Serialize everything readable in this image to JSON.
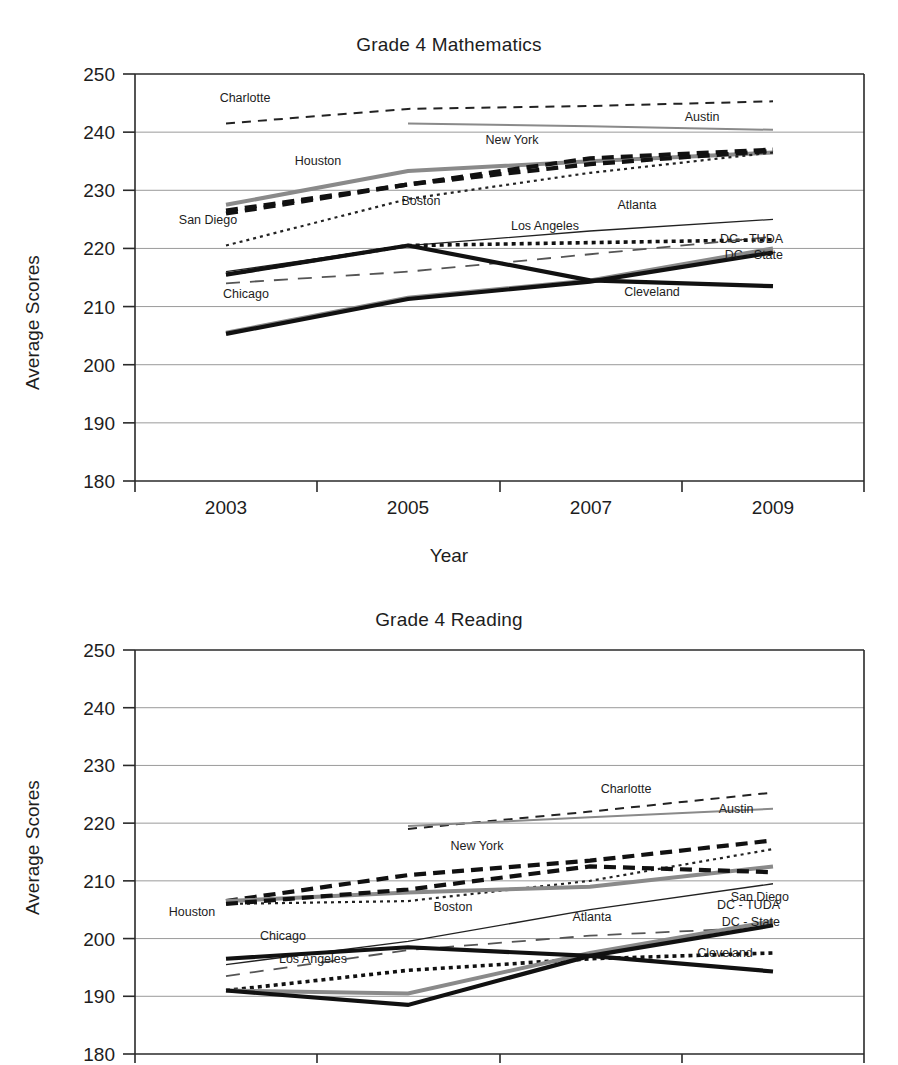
{
  "charts": [
    {
      "id": "math",
      "title": "Grade 4 Mathematics",
      "ylabel": "Average Scores",
      "xlabel": "Year"
    },
    {
      "id": "reading",
      "title": "Grade 4 Reading",
      "ylabel": "Average Scores",
      "xlabel": ""
    }
  ],
  "chart_data": [
    {
      "type": "line",
      "title": "Grade 4 Mathematics",
      "xlabel": "Year",
      "ylabel": "Average Scores",
      "x": [
        2003,
        2005,
        2007,
        2009
      ],
      "xticklabels": [
        "2003",
        "2005",
        "2007",
        "2009"
      ],
      "yticklabels": [
        "180",
        "190",
        "200",
        "210",
        "220",
        "230",
        "240",
        "250"
      ],
      "ylim": [
        180,
        250
      ],
      "grid": true,
      "legend": "inline-annotations",
      "series": [
        {
          "name": "Charlotte",
          "values": [
            241.5,
            244.0,
            244.5,
            245.3
          ],
          "style": "dashed-thin",
          "color": "#222222"
        },
        {
          "name": "Austin",
          "values": [
            null,
            241.5,
            241.0,
            240.4
          ],
          "style": "solid-gray",
          "color": "#8a8a8a"
        },
        {
          "name": "Houston",
          "values": [
            227.5,
            233.3,
            235.0,
            236.5
          ],
          "style": "solid-gray-thick",
          "color": "#8a8a8a"
        },
        {
          "name": "New York",
          "values": [
            226.0,
            231.0,
            235.5,
            237.0
          ],
          "style": "dashed-bold",
          "color": "#111111"
        },
        {
          "name": "Boston",
          "values": [
            220.5,
            228.5,
            233.0,
            236.5
          ],
          "style": "dotted-fine",
          "color": "#222222"
        },
        {
          "name": "San Diego",
          "values": [
            226.5,
            231.0,
            234.5,
            236.8
          ],
          "style": "dashed-bold",
          "color": "#111111"
        },
        {
          "name": "Atlanta",
          "values": [
            216.0,
            220.5,
            223.0,
            225.0
          ],
          "style": "solid-thin",
          "color": "#222222"
        },
        {
          "name": "Los Angeles",
          "values": [
            215.5,
            220.5,
            221.0,
            221.5
          ],
          "style": "dotted-bold",
          "color": "#111111"
        },
        {
          "name": "Chicago",
          "values": [
            214.0,
            216.0,
            219.0,
            222.0
          ],
          "style": "dashed-long",
          "color": "#555555"
        },
        {
          "name": "DC - TUDA",
          "values": [
            205.5,
            211.5,
            214.5,
            220.0
          ],
          "style": "solid-gray-thick",
          "color": "#8a8a8a"
        },
        {
          "name": "DC - State",
          "values": [
            205.3,
            211.3,
            214.3,
            219.3
          ],
          "style": "solid-black-thick",
          "color": "#111111"
        },
        {
          "name": "Cleveland",
          "values": [
            215.5,
            220.5,
            214.5,
            213.5
          ],
          "style": "solid-black-thick",
          "color": "#111111"
        }
      ],
      "annotations": [
        {
          "text": "Charlotte",
          "x": 245,
          "y": 121
        },
        {
          "text": "Austin",
          "x": 702,
          "y": 140
        },
        {
          "text": "Houston",
          "x": 318,
          "y": 184
        },
        {
          "text": "New York",
          "x": 512,
          "y": 163
        },
        {
          "text": "Boston",
          "x": 421,
          "y": 224
        },
        {
          "text": "San Diego",
          "x": 208,
          "y": 243
        },
        {
          "text": "Atlanta",
          "x": 637,
          "y": 228
        },
        {
          "text": "Los Angeles",
          "x": 545,
          "y": 249
        },
        {
          "text": "DC - TUDA",
          "x": 783,
          "y": 262
        },
        {
          "text": "DC - State",
          "x": 783,
          "y": 278
        },
        {
          "text": "Chicago",
          "x": 246,
          "y": 317
        },
        {
          "text": "Cleveland",
          "x": 652,
          "y": 315
        }
      ]
    },
    {
      "type": "line",
      "title": "Grade 4 Reading",
      "xlabel": "",
      "ylabel": "Average Scores",
      "x": [
        2003,
        2005,
        2007,
        2009
      ],
      "xticklabels": [],
      "yticklabels": [
        "180",
        "190",
        "200",
        "210",
        "220",
        "230",
        "240",
        "250"
      ],
      "ylim": [
        180,
        250
      ],
      "grid": true,
      "legend": "inline-annotations",
      "series": [
        {
          "name": "Charlotte",
          "values": [
            null,
            219.0,
            222.0,
            225.3
          ],
          "style": "dashed-thin",
          "color": "#222222"
        },
        {
          "name": "Austin",
          "values": [
            null,
            219.5,
            221.0,
            222.5
          ],
          "style": "solid-gray",
          "color": "#8a8a8a"
        },
        {
          "name": "New York",
          "values": [
            206.5,
            211.0,
            213.5,
            217.0
          ],
          "style": "dashed-bold",
          "color": "#111111"
        },
        {
          "name": "Boston",
          "values": [
            206.0,
            206.5,
            210.0,
            215.5
          ],
          "style": "dotted-fine",
          "color": "#222222"
        },
        {
          "name": "Houston",
          "values": [
            206.5,
            208.0,
            209.0,
            212.5
          ],
          "style": "solid-gray-thick",
          "color": "#8a8a8a"
        },
        {
          "name": "San Diego",
          "values": [
            206.0,
            208.5,
            212.5,
            211.5
          ],
          "style": "dashed-bold",
          "color": "#111111"
        },
        {
          "name": "Atlanta",
          "values": [
            195.5,
            199.5,
            205.0,
            209.5
          ],
          "style": "solid-thin",
          "color": "#222222"
        },
        {
          "name": "Chicago",
          "values": [
            193.5,
            198.0,
            200.5,
            202.0
          ],
          "style": "dashed-long",
          "color": "#555555"
        },
        {
          "name": "Los Angeles",
          "values": [
            191.0,
            194.5,
            196.5,
            197.5
          ],
          "style": "dotted-bold",
          "color": "#111111"
        },
        {
          "name": "DC - TUDA",
          "values": [
            191.0,
            190.5,
            197.5,
            203.0
          ],
          "style": "solid-gray-thick",
          "color": "#8a8a8a"
        },
        {
          "name": "DC - State",
          "values": [
            191.0,
            188.5,
            197.0,
            202.3
          ],
          "style": "solid-black-thick",
          "color": "#111111"
        },
        {
          "name": "Cleveland",
          "values": [
            196.5,
            198.5,
            197.0,
            194.3
          ],
          "style": "solid-black-thick",
          "color": "#111111"
        }
      ],
      "annotations": [
        {
          "text": "Charlotte",
          "x": 626,
          "y": 795
        },
        {
          "text": "Austin",
          "x": 736,
          "y": 815
        },
        {
          "text": "New York",
          "x": 477,
          "y": 852
        },
        {
          "text": "Boston",
          "x": 453,
          "y": 913
        },
        {
          "text": "Houston",
          "x": 192,
          "y": 918
        },
        {
          "text": "San Diego",
          "x": 789,
          "y": 903
        },
        {
          "text": "Atlanta",
          "x": 592,
          "y": 923
        },
        {
          "text": "DC - TUDA",
          "x": 780,
          "y": 911
        },
        {
          "text": "DC - State",
          "x": 780,
          "y": 928
        },
        {
          "text": "Chicago",
          "x": 283,
          "y": 942
        },
        {
          "text": "Los Angeles",
          "x": 313,
          "y": 965
        },
        {
          "text": "Cleveland",
          "x": 725,
          "y": 959
        }
      ]
    }
  ]
}
